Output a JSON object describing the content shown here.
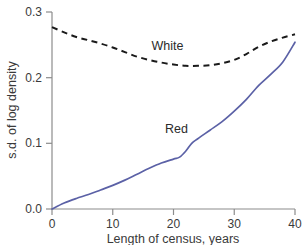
{
  "chart_data": {
    "type": "line",
    "title": "",
    "xlabel": "Length of census, years",
    "ylabel": "s.d. of log density",
    "xlim": [
      0,
      40
    ],
    "ylim": [
      0.0,
      0.3
    ],
    "xticks": [
      "0",
      "10",
      "20",
      "30",
      "40"
    ],
    "xtick_values": [
      0,
      10,
      20,
      30,
      40
    ],
    "yticks": [
      "0.0",
      "0.1",
      "0.2",
      "0.3"
    ],
    "ytick_values": [
      0.0,
      0.1,
      0.2,
      0.3
    ],
    "grid": false,
    "legend_position": "inline-annotations",
    "series": [
      {
        "name": "White",
        "label": "White",
        "style": "dashed",
        "color": "#1a1a1a",
        "x": [
          0,
          2,
          4,
          6,
          8,
          10,
          12,
          14,
          16,
          18,
          20,
          22,
          24,
          26,
          28,
          30,
          32,
          34,
          36,
          38,
          40
        ],
        "values": [
          0.277,
          0.269,
          0.262,
          0.257,
          0.252,
          0.246,
          0.239,
          0.232,
          0.227,
          0.223,
          0.22,
          0.218,
          0.218,
          0.219,
          0.222,
          0.227,
          0.236,
          0.247,
          0.255,
          0.261,
          0.266
        ]
      },
      {
        "name": "Red",
        "label": "Red",
        "style": "solid",
        "color": "#5b61a6",
        "x": [
          0,
          2,
          4,
          6,
          8,
          10,
          12,
          14,
          16,
          18,
          20,
          21,
          22,
          23,
          24,
          26,
          28,
          30,
          32,
          34,
          36,
          38,
          40
        ],
        "values": [
          0.0,
          0.009,
          0.016,
          0.022,
          0.029,
          0.036,
          0.044,
          0.053,
          0.062,
          0.07,
          0.076,
          0.079,
          0.088,
          0.1,
          0.107,
          0.12,
          0.133,
          0.149,
          0.167,
          0.188,
          0.205,
          0.224,
          0.254
        ]
      }
    ],
    "annotations": [
      {
        "text": "White",
        "x": 19.0,
        "y": 0.242
      },
      {
        "text": "Red",
        "x": 20.5,
        "y": 0.115
      }
    ]
  }
}
